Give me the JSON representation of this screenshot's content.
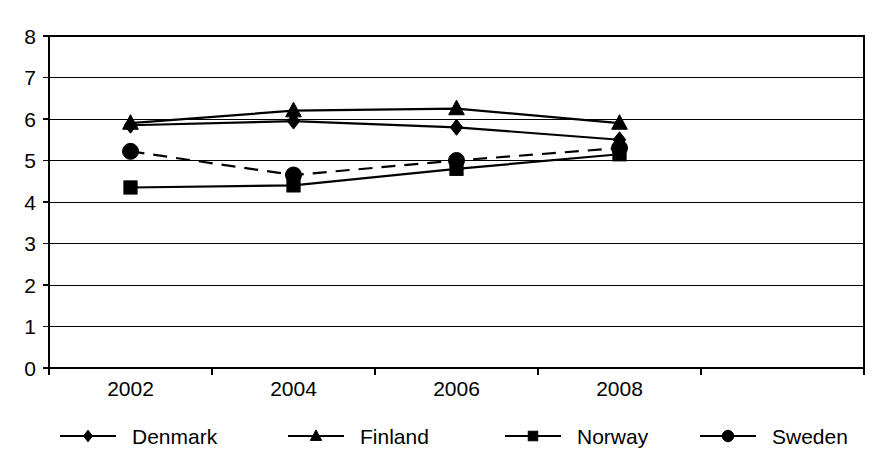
{
  "chart_data": {
    "type": "line",
    "title": "",
    "subtitle": "",
    "xlabel": "",
    "ylabel": "",
    "categories": [
      "2002",
      "2004",
      "2006",
      "2008"
    ],
    "x": [
      2002,
      2004,
      2006,
      2008
    ],
    "ylim": [
      0,
      8
    ],
    "ytick_labels": [
      "0",
      "1",
      "2",
      "3",
      "4",
      "5",
      "6",
      "7",
      "8"
    ],
    "ytick_values": [
      0,
      1,
      2,
      3,
      4,
      5,
      6,
      7,
      8
    ],
    "grid": true,
    "grid_axis": "y",
    "legend_position": "bottom",
    "series": [
      {
        "name": "Denmark",
        "marker": "diamond",
        "line_style": "solid",
        "color": "#000000",
        "values": [
          5.85,
          5.95,
          5.8,
          5.5
        ]
      },
      {
        "name": "Finland",
        "marker": "triangle",
        "line_style": "solid",
        "color": "#000000",
        "values": [
          5.9,
          6.2,
          6.25,
          5.9
        ]
      },
      {
        "name": "Norway",
        "marker": "square",
        "line_style": "solid",
        "color": "#000000",
        "values": [
          4.35,
          4.4,
          4.8,
          5.15
        ]
      },
      {
        "name": "Sweden",
        "marker": "circle",
        "line_style": "dashed",
        "color": "#000000",
        "values": [
          5.22,
          4.65,
          5.0,
          5.3
        ]
      }
    ]
  },
  "axes": {
    "y_ticks": [
      {
        "label": "8",
        "value": 8
      },
      {
        "label": "7",
        "value": 7
      },
      {
        "label": "6",
        "value": 6
      },
      {
        "label": "5",
        "value": 5
      },
      {
        "label": "4",
        "value": 4
      },
      {
        "label": "3",
        "value": 3
      },
      {
        "label": "2",
        "value": 2
      },
      {
        "label": "1",
        "value": 1
      },
      {
        "label": "0",
        "value": 0
      }
    ],
    "x_ticks": [
      {
        "label": "2002"
      },
      {
        "label": "2004"
      },
      {
        "label": "2006"
      },
      {
        "label": "2008"
      }
    ]
  },
  "legend": {
    "items": [
      {
        "label": "Denmark",
        "marker": "diamond",
        "line_style": "solid"
      },
      {
        "label": "Finland",
        "marker": "triangle",
        "line_style": "solid"
      },
      {
        "label": "Norway",
        "marker": "square",
        "line_style": "solid"
      },
      {
        "label": "Sweden",
        "marker": "circle",
        "line_style": "solid"
      }
    ]
  },
  "colors": {
    "foreground": "#000000",
    "background": "#ffffff",
    "gridline": "#000000"
  }
}
